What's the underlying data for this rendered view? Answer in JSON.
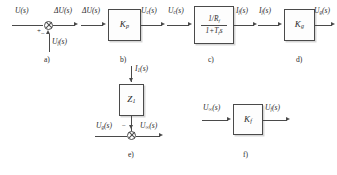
{
  "figure": {
    "type": "control-system-block-diagram",
    "panel_count": 6,
    "line_color": "#4a4a4a",
    "background": "#ffffff"
  },
  "panels": {
    "a": {
      "caption": "a)",
      "element": "summing-junction",
      "inputs": [
        {
          "label_html": "U(s)",
          "from": "left",
          "sign": "+"
        },
        {
          "label_html": "U<sub>f</sub>(s)",
          "from": "bottom",
          "sign": "−"
        }
      ],
      "outputs": [
        {
          "label_html": "ΔU(s)",
          "to": "right"
        }
      ],
      "sign_left": "+",
      "sign_bottom": "−"
    },
    "b": {
      "caption": "b)",
      "element": "gain-block",
      "gain_html": "K<sub>p</sub>",
      "input_html": "ΔU(s)",
      "output_html": "U<sub>c</sub>(s)"
    },
    "c": {
      "caption": "c)",
      "element": "transfer-function-block",
      "numerator_html": "1/R<sub>f</sub>",
      "denominator_html": "1+T<sub>f</sub>s",
      "input_html": "U<sub>c</sub>(s)",
      "output_html": "I<sub>f</sub>(s)"
    },
    "d": {
      "caption": "d)",
      "element": "gain-block",
      "gain_html": "K<sub>g</sub>",
      "input_html": "I<sub>f</sub>(s)",
      "output_html": "U<sub>g</sub>(s)"
    },
    "e": {
      "caption": "e)",
      "element": "impedance-block-with-summing-junction",
      "impedance_html": "Z<sub>1</sub>",
      "top_input_html": "I<sub>1</sub>(s)",
      "left_input_html": "U<sub>g</sub>(s)",
      "output_html": "U<sub>∞</sub>(s)",
      "sign_top": "−"
    },
    "f": {
      "caption": "f)",
      "element": "gain-block",
      "gain_html": "K<sub>f</sub>",
      "input_html": "U<sub>∞</sub>(s)",
      "output_html": "U<sub>f</sub>(s)"
    }
  }
}
